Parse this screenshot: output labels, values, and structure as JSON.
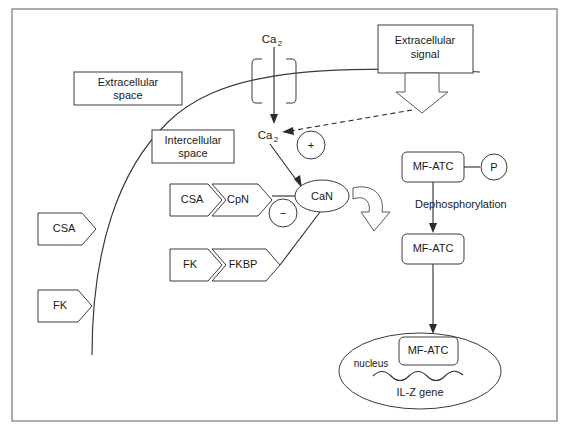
{
  "diagram": {
    "frame": {
      "name": "outer-frame"
    },
    "membrane": {
      "name": "cell-membrane"
    },
    "labels": {
      "extracellular_space": "Extracellular\nspace",
      "extracellular_space_line1": "Extracellular",
      "extracellular_space_line2": "space",
      "intercellular_space_line1": "Intercellular",
      "intercellular_space_line2": "space",
      "extracellular_signal_line1": "Extracellular",
      "extracellular_signal_line2": "signal",
      "calcium_outside": "Ca",
      "calcium_outside_sub": "2",
      "calcium_inside": "Ca",
      "calcium_inside_sub": "2",
      "plus_sign": "+",
      "minus_sign": "−",
      "csa_outer": "CSA",
      "fk_outer": "FK",
      "csa_complex": "CSA",
      "cpn_complex": "CpN",
      "fk_complex": "FK",
      "fkbp_complex": "FKBP",
      "can": "CaN",
      "mf_atc_phospho": "MF-ATC",
      "phosphate": "P",
      "dephosphorylation": "Dephosphorylation",
      "mf_atc_dephospho": "MF-ATC",
      "mf_atc_nucleus": "MF-ATC",
      "nucleus": "nucleus",
      "il_z_gene": "IL-Z gene"
    },
    "colors": {
      "stroke": "#3a3a3a",
      "frame": "#8a8a8a",
      "text": "#1a1a1a",
      "background": "#ffffff",
      "block_arrow_stroke": "#5a5a5a"
    }
  }
}
